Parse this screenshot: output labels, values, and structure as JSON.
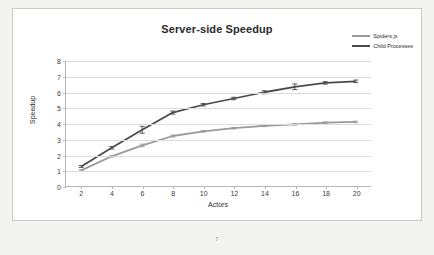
{
  "chart_data": {
    "type": "line",
    "title": "Server-side Speedup",
    "xlabel": "Actors",
    "ylabel": "Speedup",
    "xlim": [
      1,
      21
    ],
    "ylim": [
      0,
      8
    ],
    "grid": true,
    "legend_position": "top-right",
    "x": [
      2,
      4,
      6,
      8,
      10,
      12,
      14,
      16,
      18,
      20
    ],
    "xticks": [
      "2",
      "4",
      "6",
      "8",
      "10",
      "12",
      "14",
      "16",
      "18",
      "20"
    ],
    "yticks": [
      "0",
      "1",
      "2",
      "3",
      "4",
      "5",
      "6",
      "7",
      "8"
    ],
    "series": [
      {
        "name": "Spiders.js",
        "color": "#9a9a9a",
        "values": [
          1.0,
          1.9,
          2.6,
          3.2,
          3.5,
          3.7,
          3.85,
          3.95,
          4.05,
          4.1
        ],
        "errors": [
          0.05,
          0.05,
          0.08,
          0.06,
          0.05,
          0.05,
          0.05,
          0.05,
          0.05,
          0.05
        ]
      },
      {
        "name": "Child Processes",
        "color": "#4a4a4a",
        "values": [
          1.25,
          2.45,
          3.6,
          4.7,
          5.2,
          5.6,
          6.0,
          6.35,
          6.6,
          6.7
        ],
        "errors": [
          0.06,
          0.08,
          0.22,
          0.1,
          0.08,
          0.08,
          0.1,
          0.18,
          0.08,
          0.08
        ]
      }
    ]
  },
  "footer": {
    "page_marker": "7"
  }
}
